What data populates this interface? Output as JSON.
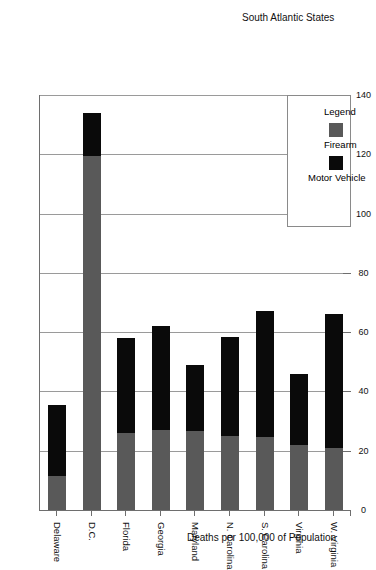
{
  "chart_data": {
    "type": "bar",
    "stacked": true,
    "title": "",
    "xlabel": "South Atlantic States",
    "ylabel": "Deaths per 100,000 of Population",
    "ylim": [
      0,
      140
    ],
    "yticks": [
      0,
      20,
      40,
      60,
      80,
      100,
      120,
      140
    ],
    "grid": true,
    "orientation": "vertical-rotated-90",
    "legend": {
      "title": "Legend",
      "position": "top-left",
      "entries": [
        {
          "name": "Firearm",
          "color": "#595959"
        },
        {
          "name": "Motor Vehicle",
          "color": "#0a0a0a"
        }
      ]
    },
    "categories": [
      "W. Virginia",
      "Virginia",
      "S. Carolina",
      "N. Carolina",
      "Maryland",
      "Georgia",
      "Florida",
      "D.C.",
      "Delaware"
    ],
    "series": [
      {
        "name": "Firearm",
        "color": "#595959",
        "values": [
          21,
          22,
          24.5,
          25,
          26.5,
          27,
          26,
          119.5,
          11.5
        ]
      },
      {
        "name": "Motor Vehicle",
        "color": "#0a0a0a",
        "values": [
          45,
          24,
          42.5,
          33.5,
          22.5,
          35,
          32,
          14.5,
          24
        ]
      }
    ],
    "totals": [
      66,
      46,
      67,
      58.5,
      49,
      62,
      58,
      134,
      35.5
    ]
  },
  "axes": {
    "y_tick_labels": [
      "0",
      "20",
      "40",
      "60",
      "80",
      "100",
      "120",
      "140"
    ],
    "y_axis_title": "Deaths per 100,000 of Population",
    "x_axis_title": "South Atlantic States"
  },
  "legend": {
    "title": "Legend",
    "firearm_label": "Firearm",
    "motor_vehicle_label": "Motor Vehicle",
    "firearm_color": "#595959",
    "motor_vehicle_color": "#0a0a0a"
  }
}
